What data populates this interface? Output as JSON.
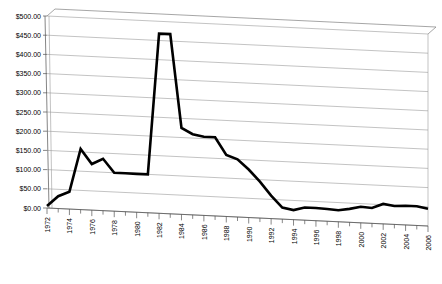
{
  "chart_data": {
    "type": "line",
    "title": "",
    "subtitle": "",
    "xlabel": "",
    "ylabel": "",
    "grid": true,
    "legend": "none",
    "style": "3d-perspective-line",
    "line_color": "#000000",
    "grid_color": "#9a9a9a",
    "axis_color": "#808080",
    "plot_background": "#ffffff",
    "ylim": [
      0,
      500
    ],
    "ytick_step": 50,
    "y_tick_labels": [
      "$0.00",
      "$50.00",
      "$100.00",
      "$150.00",
      "$200.00",
      "$250.00",
      "$300.00",
      "$350.00",
      "$400.00",
      "$450.00",
      "$500.00"
    ],
    "y_tick_values": [
      0,
      50,
      100,
      150,
      200,
      250,
      300,
      350,
      400,
      450,
      500
    ],
    "xlim": [
      1972,
      2006
    ],
    "xtick_step": 2,
    "x_tick_labels": [
      "1972",
      "1974",
      "1976",
      "1978",
      "1980",
      "1982",
      "1984",
      "1986",
      "1988",
      "1990",
      "1992",
      "1994",
      "1996",
      "1998",
      "2000",
      "2002",
      "2004",
      "2006"
    ],
    "x": [
      1972,
      1973,
      1974,
      1975,
      1976,
      1977,
      1978,
      1979,
      1980,
      1981,
      1982,
      1983,
      1984,
      1985,
      1986,
      1987,
      1988,
      1989,
      1990,
      1991,
      1992,
      1993,
      1994,
      1995,
      1996,
      1997,
      1998,
      1999,
      2000,
      2001,
      2002,
      2003,
      2004,
      2005,
      2006
    ],
    "values": [
      5,
      32,
      45,
      158,
      120,
      135,
      100,
      100,
      100,
      100,
      468,
      468,
      225,
      210,
      205,
      205,
      160,
      150,
      125,
      95,
      60,
      30,
      25,
      33,
      33,
      32,
      30,
      35,
      42,
      40,
      52,
      48,
      50,
      50,
      45
    ],
    "series_name": ""
  }
}
